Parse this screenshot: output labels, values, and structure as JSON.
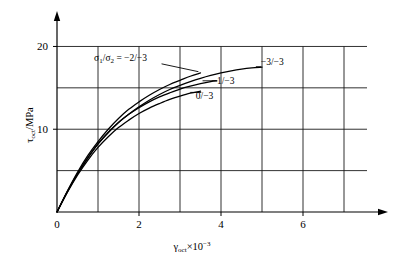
{
  "chart_data": {
    "type": "line",
    "title": "",
    "xlabel": "γoct × 10⁻³",
    "ylabel": "τoct /MPa",
    "xlim": [
      0,
      8
    ],
    "ylim": [
      0,
      23.8
    ],
    "grid": true,
    "grid_x": [
      1,
      2,
      3,
      4,
      5,
      6,
      7
    ],
    "grid_y": [
      5,
      10,
      15,
      20
    ],
    "xticks": [
      0,
      2,
      4,
      6
    ],
    "xtick_labels": [
      "0",
      "2",
      "4",
      "6"
    ],
    "yticks": [
      10,
      20
    ],
    "ytick_labels": [
      "10",
      "20"
    ],
    "legend_position": "inline-annotations",
    "series": [
      {
        "name": "-3/-3",
        "label": "−3/−3",
        "points": [
          [
            0,
            0
          ],
          [
            0.25,
            2.4
          ],
          [
            0.5,
            4.6
          ],
          [
            0.75,
            6.5
          ],
          [
            1,
            8.2
          ],
          [
            1.25,
            9.6
          ],
          [
            1.5,
            10.8
          ],
          [
            1.75,
            11.8
          ],
          [
            2,
            12.7
          ],
          [
            2.25,
            13.5
          ],
          [
            2.5,
            14.2
          ],
          [
            2.75,
            14.8
          ],
          [
            3,
            15.3
          ],
          [
            3.25,
            15.75
          ],
          [
            3.5,
            16.15
          ],
          [
            3.75,
            16.5
          ],
          [
            4,
            16.8
          ],
          [
            4.25,
            17.05
          ],
          [
            4.5,
            17.25
          ],
          [
            4.75,
            17.4
          ],
          [
            5,
            17.5
          ]
        ]
      },
      {
        "name": "-2/-3",
        "label": "−2/−3",
        "points": [
          [
            0,
            0
          ],
          [
            0.25,
            2.5
          ],
          [
            0.5,
            4.8
          ],
          [
            0.75,
            6.8
          ],
          [
            1,
            8.5
          ],
          [
            1.25,
            10.0
          ],
          [
            1.5,
            11.3
          ],
          [
            1.75,
            12.4
          ],
          [
            2,
            13.3
          ],
          [
            2.25,
            14.1
          ],
          [
            2.5,
            14.8
          ],
          [
            2.75,
            15.4
          ],
          [
            3,
            15.9
          ],
          [
            3.25,
            16.4
          ],
          [
            3.5,
            16.8
          ]
        ]
      },
      {
        "name": "-1/-3",
        "label": "−1/−3",
        "points": [
          [
            0,
            0
          ],
          [
            0.25,
            2.45
          ],
          [
            0.5,
            4.65
          ],
          [
            0.75,
            6.55
          ],
          [
            1,
            8.25
          ],
          [
            1.25,
            9.6
          ],
          [
            1.5,
            10.8
          ],
          [
            1.75,
            11.8
          ],
          [
            2,
            12.6
          ],
          [
            2.25,
            13.3
          ],
          [
            2.5,
            13.9
          ],
          [
            2.75,
            14.4
          ],
          [
            3,
            14.85
          ],
          [
            3.25,
            15.2
          ],
          [
            3.5,
            15.5
          ],
          [
            3.75,
            15.75
          ],
          [
            3.9,
            15.85
          ]
        ]
      },
      {
        "name": "0/-3",
        "label": "0/−3",
        "points": [
          [
            0,
            0
          ],
          [
            0.25,
            2.35
          ],
          [
            0.5,
            4.45
          ],
          [
            0.75,
            6.25
          ],
          [
            1,
            7.8
          ],
          [
            1.25,
            9.1
          ],
          [
            1.5,
            10.2
          ],
          [
            1.75,
            11.1
          ],
          [
            2,
            11.9
          ],
          [
            2.25,
            12.55
          ],
          [
            2.5,
            13.1
          ],
          [
            2.75,
            13.6
          ],
          [
            3,
            14.0
          ],
          [
            3.25,
            14.35
          ],
          [
            3.5,
            14.6
          ]
        ]
      }
    ],
    "annotations": [
      {
        "name": "ratio-definition",
        "text": "σ1/σ2 = −2/−3",
        "x": 1.55,
        "y": 18.2
      },
      {
        "name": "label-3-3",
        "text": "−3/−3",
        "x": 5.25,
        "y": 17.7
      },
      {
        "name": "label-1-3",
        "text": "−1/−3",
        "x": 4.05,
        "y": 15.5
      },
      {
        "name": "label-0-3",
        "text": "0/−3",
        "x": 3.6,
        "y": 13.6
      }
    ]
  },
  "axes": {
    "y_title_main": "τ",
    "y_title_sub": "oct",
    "y_title_unit": "/MPa",
    "x_title_main": "γ",
    "x_title_sub": "oct",
    "x_title_mult": "×10",
    "x_title_exp": "−3",
    "xtick_labels": [
      "0",
      "2",
      "4",
      "6"
    ],
    "ytick_labels": [
      "10",
      "20"
    ]
  },
  "annotations_text": {
    "ratio_sigma": "σ",
    "ratio_sub1": "1",
    "ratio_slash": "/",
    "ratio_sigma2": "σ",
    "ratio_sub2": "2",
    "ratio_eq": " = −2/−3",
    "label_minus3": "−3/−3",
    "label_minus1": "−1/−3",
    "label_zero": "0/−3"
  },
  "colors": {
    "line": "#000000",
    "grid": "#1a1a1a",
    "background": "#ffffff"
  }
}
